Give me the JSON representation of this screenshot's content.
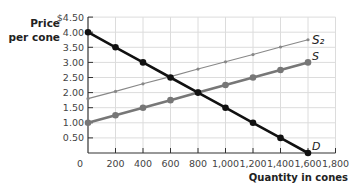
{
  "chart_data": {
    "type": "line",
    "title": "",
    "xlabel": "Quantity in cones",
    "ylabel": "Price per cone",
    "xlim": [
      0,
      1800
    ],
    "ylim": [
      0,
      4.5
    ],
    "grid": true,
    "legend_position": "inline labels at line ends",
    "x_ticks": [
      "0",
      "200",
      "400",
      "600",
      "800",
      "1,000",
      "1,200",
      "1,400",
      "1,600",
      "1,800"
    ],
    "x_tick_values": [
      0,
      200,
      400,
      600,
      800,
      1000,
      1200,
      1400,
      1600,
      1800
    ],
    "y_ticks": [
      "$4.50",
      "4.00",
      "3.50",
      "3.00",
      "2.50",
      "2.00",
      "1.50",
      "1.00",
      "0.50"
    ],
    "y_tick_values": [
      4.5,
      4.0,
      3.5,
      3.0,
      2.5,
      2.0,
      1.5,
      1.0,
      0.5
    ],
    "series": [
      {
        "name": "D",
        "label": "D",
        "color": "#111111",
        "x": [
          0,
          200,
          400,
          600,
          800,
          1000,
          1200,
          1400,
          1600
        ],
        "values": [
          4.0,
          3.5,
          3.0,
          2.5,
          2.0,
          1.5,
          1.0,
          0.5,
          0.0
        ]
      },
      {
        "name": "S",
        "label": "S",
        "color": "#777777",
        "x": [
          0,
          200,
          400,
          600,
          800,
          1000,
          1200,
          1400,
          1600
        ],
        "values": [
          1.0,
          1.25,
          1.5,
          1.75,
          2.0,
          2.25,
          2.5,
          2.75,
          3.0
        ]
      },
      {
        "name": "S2",
        "label": "S₂",
        "color": "#888888",
        "x": [
          0,
          200,
          400,
          600,
          800,
          1000,
          1200,
          1400,
          1600
        ],
        "values": [
          1.8,
          2.04,
          2.29,
          2.53,
          2.78,
          3.02,
          3.26,
          3.51,
          3.75
        ]
      }
    ],
    "annotations": [
      "S₂ (handwritten)",
      "S",
      "D"
    ]
  },
  "labels": {
    "y_axis_title": "Price\nper cone",
    "x_axis_title": "Quantity in cones"
  }
}
